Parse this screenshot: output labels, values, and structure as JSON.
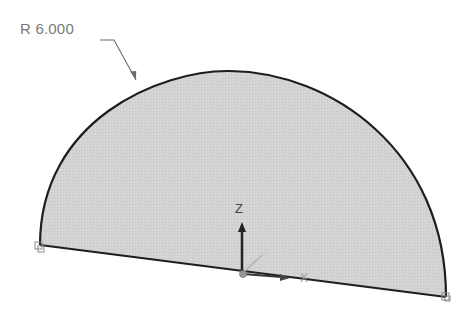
{
  "drawing": {
    "shape": "semicircle-profile",
    "dimension": {
      "type": "radius",
      "label": "R 6.000"
    },
    "colors": {
      "fill": "#d4d4d4",
      "outline": "#1e1e1e",
      "leader": "#6a6a6a",
      "background": "#ffffff"
    }
  },
  "triad": {
    "z_label": "Z",
    "x_label": "X"
  }
}
